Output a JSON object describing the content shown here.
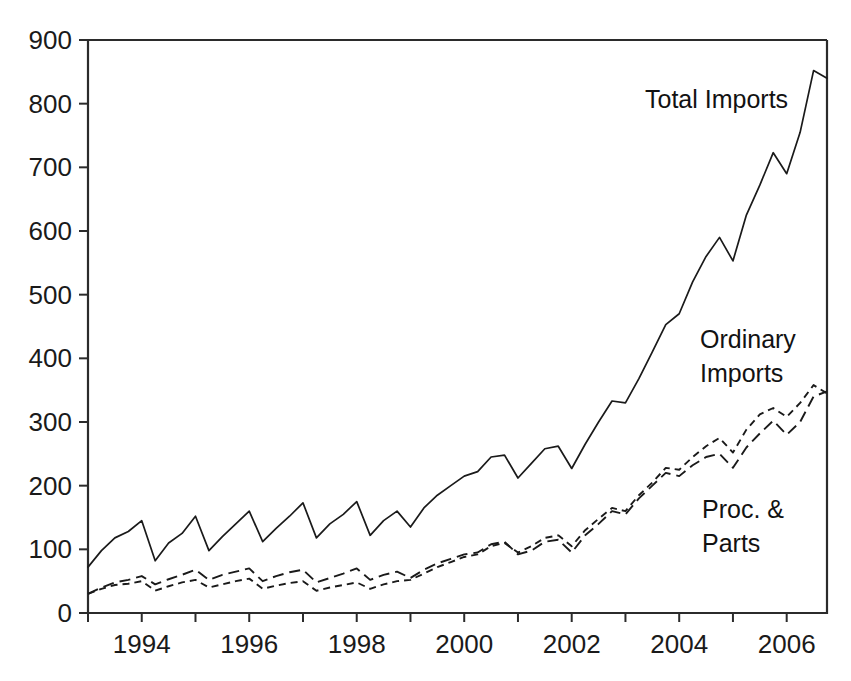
{
  "chart_data": {
    "type": "line",
    "title": "",
    "subtitle": "",
    "xlabel": "",
    "ylabel": "",
    "xlim": [
      1993.0,
      2006.75
    ],
    "ylim": [
      0,
      900
    ],
    "grid": false,
    "legend_position": "inline-annotations",
    "y_ticks": [
      "0",
      "100",
      "200",
      "300",
      "400",
      "500",
      "600",
      "700",
      "800",
      "900"
    ],
    "y_tick_values": [
      0,
      100,
      200,
      300,
      400,
      500,
      600,
      700,
      800,
      900
    ],
    "x_ticks": [
      "1994",
      "1996",
      "1998",
      "2000",
      "2002",
      "2004",
      "2006"
    ],
    "x_tick_values": [
      1994,
      1996,
      1998,
      2000,
      2002,
      2004,
      2006
    ],
    "x_minor_tick_values": [
      1993,
      1995,
      1997,
      1999,
      2001,
      2003,
      2005
    ],
    "x": [
      1993.0,
      1993.25,
      1993.5,
      1993.75,
      1994.0,
      1994.25,
      1994.5,
      1994.75,
      1995.0,
      1995.25,
      1995.5,
      1995.75,
      1996.0,
      1996.25,
      1996.5,
      1996.75,
      1997.0,
      1997.25,
      1997.5,
      1997.75,
      1998.0,
      1998.25,
      1998.5,
      1998.75,
      1999.0,
      1999.25,
      1999.5,
      1999.75,
      2000.0,
      2000.25,
      2000.5,
      2000.75,
      2001.0,
      2001.25,
      2001.5,
      2001.75,
      2002.0,
      2002.25,
      2002.5,
      2002.75,
      2003.0,
      2003.25,
      2003.5,
      2003.75,
      2004.0,
      2004.25,
      2004.5,
      2004.75,
      2005.0,
      2005.25,
      2005.5,
      2005.75,
      2006.0,
      2006.25,
      2006.5,
      2006.75
    ],
    "x_quarter_labels": [
      "1993Q1",
      "1993Q2",
      "1993Q3",
      "1993Q4",
      "1994Q1",
      "1994Q2",
      "1994Q3",
      "1994Q4",
      "1995Q1",
      "1995Q2",
      "1995Q3",
      "1995Q4",
      "1996Q1",
      "1996Q2",
      "1996Q3",
      "1996Q4",
      "1997Q1",
      "1997Q2",
      "1997Q3",
      "1997Q4",
      "1998Q1",
      "1998Q2",
      "1998Q3",
      "1998Q4",
      "1999Q1",
      "1999Q2",
      "1999Q3",
      "1999Q4",
      "2000Q1",
      "2000Q2",
      "2000Q3",
      "2000Q4",
      "2001Q1",
      "2001Q2",
      "2001Q3",
      "2001Q4",
      "2002Q1",
      "2002Q2",
      "2002Q3",
      "2002Q4",
      "2003Q1",
      "2003Q2",
      "2003Q3",
      "2003Q4",
      "2004Q1",
      "2004Q2",
      "2004Q3",
      "2004Q4",
      "2005Q1",
      "2005Q2",
      "2005Q3",
      "2005Q4",
      "2006Q1",
      "2006Q2",
      "2006Q3",
      "2006Q4"
    ],
    "series": [
      {
        "name": "Total Imports",
        "style": "solid",
        "values": [
          72,
          98,
          118,
          128,
          145,
          82,
          110,
          125,
          152,
          98,
          120,
          140,
          160,
          112,
          133,
          152,
          173,
          118,
          140,
          155,
          175,
          122,
          145,
          160,
          135,
          165,
          185,
          200,
          215,
          222,
          245,
          248,
          212,
          235,
          258,
          262,
          227,
          265,
          300,
          333,
          330,
          368,
          410,
          453,
          470,
          520,
          560,
          590,
          553,
          625,
          672,
          723,
          690,
          755,
          852,
          840
        ]
      },
      {
        "name": "Ordinary Imports",
        "style": "dash-long",
        "values": [
          30,
          40,
          48,
          52,
          58,
          45,
          53,
          60,
          68,
          52,
          60,
          65,
          70,
          50,
          58,
          64,
          68,
          48,
          55,
          62,
          70,
          52,
          60,
          65,
          55,
          68,
          78,
          85,
          92,
          95,
          108,
          112,
          92,
          98,
          112,
          115,
          95,
          122,
          140,
          160,
          155,
          180,
          200,
          220,
          215,
          232,
          245,
          250,
          228,
          260,
          282,
          302,
          280,
          300,
          340,
          348
        ]
      },
      {
        "name": "Proc. & Parts",
        "style": "dash-short",
        "values": [
          30,
          38,
          44,
          46,
          50,
          35,
          42,
          48,
          52,
          40,
          45,
          50,
          54,
          38,
          43,
          47,
          50,
          35,
          40,
          44,
          48,
          38,
          45,
          50,
          52,
          62,
          72,
          80,
          88,
          92,
          105,
          110,
          95,
          105,
          118,
          122,
          105,
          130,
          148,
          165,
          160,
          185,
          205,
          228,
          225,
          245,
          262,
          275,
          252,
          288,
          312,
          322,
          308,
          330,
          358,
          345
        ]
      }
    ],
    "annotations": [
      {
        "id": "total-imports",
        "text": "Total Imports",
        "lines": [
          "Total Imports"
        ],
        "x": 645,
        "y": 108
      },
      {
        "id": "ordinary-imports",
        "text": "Ordinary Imports",
        "lines": [
          "Ordinary",
          "Imports"
        ],
        "x": 700,
        "y": 348
      },
      {
        "id": "proc-and-parts",
        "text": "Proc. & Parts",
        "lines": [
          "Proc. &",
          "Parts"
        ],
        "x": 702,
        "y": 518
      }
    ]
  }
}
